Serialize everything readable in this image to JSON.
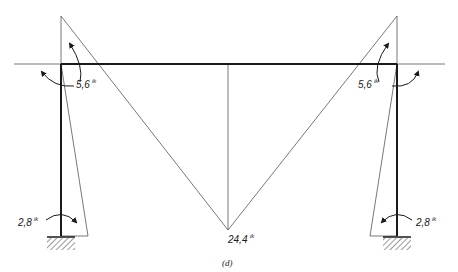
{
  "figure": {
    "caption": "(d)"
  },
  "frame": {
    "left_column_x": 61,
    "right_column_x": 397,
    "beam_y": 64,
    "base_y": 236,
    "stroke_color": "#1a1a1a"
  },
  "moments": {
    "left_joint": {
      "value": "5,6",
      "unit": "ik"
    },
    "right_joint": {
      "value": "5,6",
      "unit": "ik"
    },
    "left_base": {
      "value": "2,8",
      "unit": "ik"
    },
    "right_base": {
      "value": "2,8",
      "unit": "ik"
    },
    "midspan": {
      "value": "24,4",
      "unit": "ik"
    }
  },
  "colors": {
    "line": "#1a1a1a",
    "diagram_line": "#555555",
    "background": "#ffffff"
  }
}
